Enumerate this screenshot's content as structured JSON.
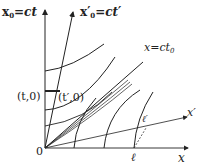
{
  "diagram": {
    "type": "minkowski-spacetime-diagram",
    "labels": {
      "x0_axis": "x₀=ct",
      "x0_axis_main": "x",
      "x0_axis_sub": "0",
      "x0_axis_rest": "=ct",
      "x0p_axis_main": "x",
      "x0p_axis_prime": "′",
      "x0p_axis_sub": "0",
      "x0p_axis_rest": "=ct′",
      "lightline_main": "x=ct",
      "lightline_sub": "0",
      "x_prime_axis": "x′",
      "x_axis": "x",
      "origin": "0",
      "t_point": "(t,0)",
      "t_prime_point": "(t′,0)",
      "ell": "ℓ",
      "ell_prime": "ℓ′"
    },
    "colors": {
      "line": "#222222",
      "background": "#ffffff"
    }
  }
}
